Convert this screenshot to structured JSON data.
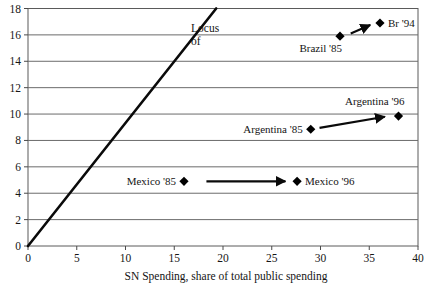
{
  "chart_data": {
    "type": "scatter",
    "title": "",
    "xlabel": "SN Spending, share of total public spending",
    "ylabel": "",
    "xlim": [
      0,
      40
    ],
    "ylim": [
      0,
      18
    ],
    "xticks": [
      "0",
      "5",
      "10",
      "15",
      "20",
      "25",
      "30",
      "35",
      "40"
    ],
    "yticks": [
      "0",
      "2",
      "4",
      "6",
      "8",
      "10",
      "12",
      "14",
      "16",
      "18"
    ],
    "grid": "horizontal",
    "legend": "none",
    "points": [
      {
        "name": "brazil-85",
        "label": "Brazil '85",
        "x": 32.0,
        "y": 15.9,
        "label_pos": "below-left"
      },
      {
        "name": "brazil-94",
        "label": "Br '94",
        "x": 36.1,
        "y": 16.9,
        "label_pos": "right"
      },
      {
        "name": "argentina-85",
        "label": "Argentina '85",
        "x": 29.0,
        "y": 8.85,
        "label_pos": "left"
      },
      {
        "name": "argentina-96",
        "label": "Argentina '96",
        "x": 38.0,
        "y": 9.85,
        "label_pos": "above-left"
      },
      {
        "name": "mexico-85",
        "label": "Mexico '85",
        "x": 16.0,
        "y": 4.9,
        "label_pos": "left"
      },
      {
        "name": "mexico-96",
        "label": "Mexico '96",
        "x": 27.6,
        "y": 4.9,
        "label_pos": "right"
      }
    ],
    "arrows": [
      {
        "name": "brazil-arrow",
        "x1": 33.1,
        "y1": 16.1,
        "x2": 35.1,
        "y2": 16.75
      },
      {
        "name": "argentina-arrow",
        "x1": 29.9,
        "y1": 8.95,
        "x2": 36.6,
        "y2": 9.8
      },
      {
        "name": "mexico-arrow",
        "x1": 18.3,
        "y1": 4.9,
        "x2": 26.4,
        "y2": 4.9
      }
    ],
    "locus_line": {
      "name": "locus-line",
      "x1": 0.0,
      "y1": 0.0,
      "x2": 19.3,
      "y2": 18.0,
      "annotation_line1": "Locus",
      "annotation_line2": "of"
    },
    "series": [
      {
        "name": "Brazil",
        "values": [
          {
            "year": "'85",
            "x": 32.0,
            "y": 15.9
          },
          {
            "year": "'94",
            "x": 36.1,
            "y": 16.9
          }
        ]
      },
      {
        "name": "Argentina",
        "values": [
          {
            "year": "'85",
            "x": 29.0,
            "y": 8.85
          },
          {
            "year": "'96",
            "x": 38.0,
            "y": 9.85
          }
        ]
      },
      {
        "name": "Mexico",
        "values": [
          {
            "year": "'85",
            "x": 16.0,
            "y": 4.9
          },
          {
            "year": "'96",
            "x": 27.6,
            "y": 4.9
          }
        ]
      }
    ],
    "colors": {
      "marker": "#000000",
      "gridline": "#6b6b6b",
      "axis": "#4a4a4a",
      "text": "#141414",
      "background": "#ffffff"
    }
  }
}
